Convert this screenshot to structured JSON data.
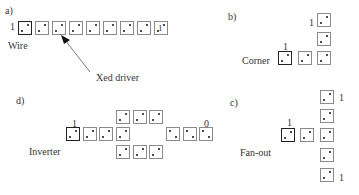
{
  "panels": {
    "a": {
      "tag": "a)",
      "name": "Wire",
      "input_label": "1",
      "output_label": "1",
      "annotation": "Xed driver"
    },
    "b": {
      "tag": "b)",
      "name": "Corner",
      "input_label": "1",
      "output_label": "1"
    },
    "c": {
      "tag": "c)",
      "name": "Fan-out",
      "input_label": "1",
      "output_top_label": "1",
      "output_bottom_label": "1"
    },
    "d": {
      "tag": "d)",
      "name": "Inverter",
      "input_label": "1",
      "output_label": "0"
    }
  },
  "colors": {
    "cell_border": "#8a8a8a",
    "driver_border": "#222222",
    "dot": "#111111"
  }
}
